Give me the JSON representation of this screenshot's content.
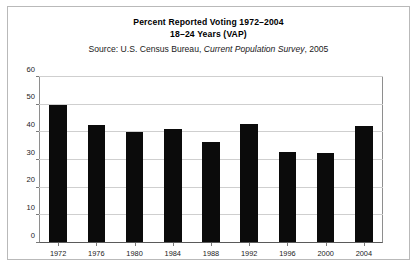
{
  "figure": {
    "title_line_1": "Percent Reported Voting 1972–2004",
    "title_line_2": "18–24 Years (VAP)",
    "source_prefix": "Source: U.S. Census Bureau,",
    "source_italic": "Current Population Survey",
    "source_suffix": ", 2005",
    "background_color": "#ffffff",
    "border_color": "#b9b9b9",
    "bar_color": "#0b0b0b",
    "gridline_color": "#cfcfcf"
  },
  "chart_data": {
    "type": "bar",
    "title": "Percent Reported Voting 1972–2004 18–24 Years (VAP)",
    "xlabel": "",
    "ylabel": "",
    "categories": [
      "1972",
      "1976",
      "1980",
      "1984",
      "1988",
      "1992",
      "1996",
      "2000",
      "2004"
    ],
    "values": [
      49.6,
      42.2,
      39.9,
      40.8,
      36.2,
      42.8,
      32.4,
      32.3,
      41.9
    ],
    "ylim": [
      0,
      60
    ],
    "yticks": [
      0,
      10,
      20,
      30,
      40,
      50,
      60
    ],
    "ytick_labels": [
      "0",
      "10",
      "20",
      "30",
      "40",
      "50",
      "60"
    ],
    "grid": true,
    "legend": false
  }
}
